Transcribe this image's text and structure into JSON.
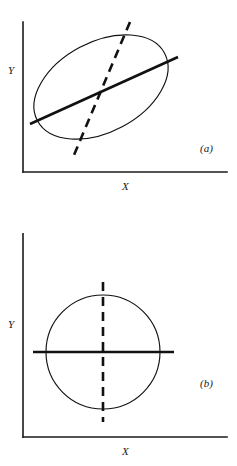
{
  "figure": {
    "background_color": "#ffffff",
    "stroke_color": "#111111",
    "axis_color": "#1a1a1a",
    "width": 237,
    "height": 466
  },
  "panels": [
    {
      "id": "a",
      "caption": "(a)",
      "caption_x": 200,
      "caption_y": 152,
      "x_axis_label": "X",
      "x_axis_label_x": 122,
      "x_axis_label_y": 190,
      "y_axis_label": "Y",
      "y_axis_label_x": 8,
      "y_axis_label_y": 74,
      "axis": {
        "origin_x": 23,
        "origin_y": 172,
        "y_top": 22,
        "x_right": 227
      },
      "envelope": {
        "type": "ellipse",
        "center_x": 101,
        "center_y": 87,
        "radius_major": 72,
        "radius_minor": 45,
        "rotation_deg": -28
      },
      "major_axis": {
        "type": "solid",
        "label": "major-axis",
        "x1": 30,
        "y1": 124,
        "x2": 178,
        "y2": 57
      },
      "minor_axis": {
        "type": "dashed",
        "label": "minor-axis",
        "x1": 130,
        "y1": 22,
        "x2": 74,
        "y2": 155
      }
    },
    {
      "id": "b",
      "caption": "(b)",
      "caption_x": 200,
      "caption_y": 387,
      "x_axis_label": "X",
      "x_axis_label_x": 122,
      "x_axis_label_y": 455,
      "y_axis_label": "Y",
      "y_axis_label_x": 8,
      "y_axis_label_y": 328,
      "axis": {
        "origin_x": 23,
        "origin_y": 437,
        "y_top": 233,
        "x_right": 227
      },
      "envelope": {
        "type": "circle",
        "center_x": 103,
        "center_y": 352,
        "radius_major": 57,
        "radius_minor": 57,
        "rotation_deg": 0
      },
      "major_axis": {
        "type": "solid",
        "label": "horizontal-axis",
        "x1": 33,
        "y1": 352,
        "x2": 174,
        "y2": 352
      },
      "minor_axis": {
        "type": "dashed",
        "label": "vertical-axis",
        "x1": 103,
        "y1": 282,
        "x2": 103,
        "y2": 422
      }
    }
  ]
}
